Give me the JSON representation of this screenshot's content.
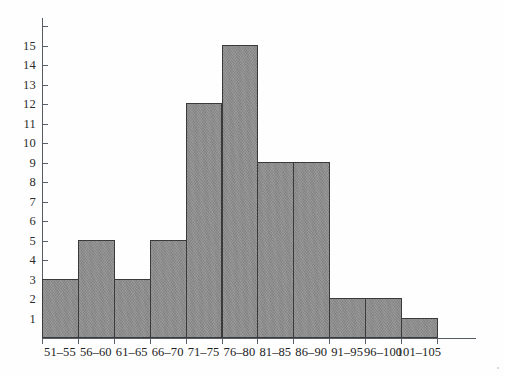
{
  "chart_data": {
    "type": "bar",
    "title": "",
    "subtitle": "",
    "xlabel": "",
    "ylabel": "",
    "categories": [
      "51–55",
      "56–60",
      "61–65",
      "66–70",
      "71–75",
      "76–80",
      "81–85",
      "86–90",
      "91–95",
      "96–100",
      "101–105"
    ],
    "values": [
      3,
      5,
      3,
      5,
      12,
      15,
      9,
      9,
      2,
      2,
      1
    ],
    "ylim": [
      0,
      16
    ],
    "xlim": [
      0,
      11
    ],
    "y_ticks": [
      1,
      2,
      3,
      4,
      5,
      6,
      7,
      8,
      9,
      10,
      11,
      12,
      13,
      14,
      15
    ],
    "y_tick_labels": [
      "1",
      "2",
      "3",
      "4",
      "5",
      "6",
      "7",
      "8",
      "9",
      "10",
      "11",
      "12",
      "13",
      "14",
      "15"
    ],
    "grid": false,
    "legend": null,
    "legend_position": "none",
    "annotations": [],
    "colors": {
      "bar_fill": "#8e8e8e",
      "bar_edge": "#3a3a3a",
      "axis": "#555c66",
      "text": "#222222",
      "background": "#fefefe"
    }
  }
}
